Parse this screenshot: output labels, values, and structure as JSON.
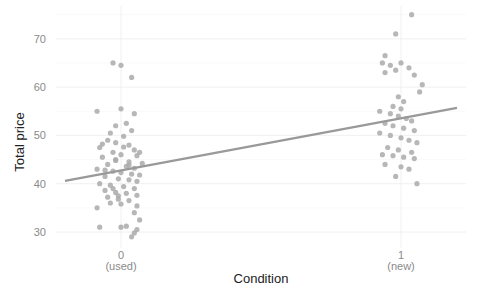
{
  "chart_data": {
    "type": "scatter",
    "title": "",
    "xlabel": "Condition",
    "ylabel": "Total price",
    "ylim": [
      27,
      76
    ],
    "yticks": [
      30,
      40,
      50,
      60,
      70
    ],
    "xticks": [
      {
        "value": 0,
        "label": "0",
        "sublabel": "(used)"
      },
      {
        "value": 1,
        "label": "1",
        "sublabel": "(new)"
      }
    ],
    "grid": true,
    "legend": null,
    "point_color": "#aaaaaa",
    "line_color": "#999999",
    "regression_line": {
      "x": [
        -0.2,
        1.2
      ],
      "y": [
        40.6,
        55.7
      ]
    },
    "series": [
      {
        "name": "used",
        "x_center": 0,
        "points": [
          [
            -0.03,
            65.0
          ],
          [
            0.0,
            64.5
          ],
          [
            0.04,
            62.0
          ],
          [
            -0.09,
            55.0
          ],
          [
            0.0,
            55.5
          ],
          [
            0.05,
            54.5
          ],
          [
            -0.02,
            52.0
          ],
          [
            0.02,
            52.5
          ],
          [
            -0.04,
            50.5
          ],
          [
            0.01,
            49.8
          ],
          [
            -0.05,
            49.0
          ],
          [
            -0.02,
            48.5
          ],
          [
            0.03,
            48.0
          ],
          [
            -0.08,
            47.5
          ],
          [
            0.05,
            47.0
          ],
          [
            -0.03,
            46.5
          ],
          [
            0.0,
            46.0
          ],
          [
            0.06,
            45.8
          ],
          [
            -0.07,
            45.5
          ],
          [
            -0.02,
            45.0
          ],
          [
            0.03,
            44.5
          ],
          [
            -0.05,
            44.0
          ],
          [
            0.02,
            43.6
          ],
          [
            0.05,
            43.2
          ],
          [
            -0.09,
            43.0
          ],
          [
            -0.03,
            42.6
          ],
          [
            0.0,
            42.3
          ],
          [
            0.04,
            42.0
          ],
          [
            0.07,
            41.8
          ],
          [
            -0.06,
            41.5
          ],
          [
            -0.01,
            41.0
          ],
          [
            0.03,
            40.8
          ],
          [
            0.06,
            40.5
          ],
          [
            -0.08,
            40.0
          ],
          [
            -0.04,
            39.7
          ],
          [
            0.01,
            39.4
          ],
          [
            0.05,
            39.0
          ],
          [
            -0.06,
            38.6
          ],
          [
            -0.02,
            38.2
          ],
          [
            0.02,
            38.0
          ],
          [
            0.06,
            37.6
          ],
          [
            -0.05,
            37.2
          ],
          [
            -0.01,
            36.8
          ],
          [
            0.03,
            36.5
          ],
          [
            -0.04,
            36.0
          ],
          [
            0.0,
            35.8
          ],
          [
            0.06,
            35.4
          ],
          [
            -0.09,
            35.0
          ],
          [
            0.05,
            34.0
          ],
          [
            0.07,
            32.5
          ],
          [
            -0.08,
            31.0
          ],
          [
            0.02,
            31.2
          ],
          [
            0.0,
            31.0
          ],
          [
            0.06,
            30.5
          ],
          [
            0.05,
            29.8
          ],
          [
            0.04,
            29.0
          ],
          [
            -0.02,
            44.8
          ],
          [
            0.01,
            47.6
          ],
          [
            -0.06,
            42.8
          ],
          [
            0.08,
            44.2
          ],
          [
            -0.03,
            39.0
          ],
          [
            0.07,
            46.5
          ],
          [
            -0.07,
            48.2
          ],
          [
            0.04,
            51.0
          ],
          [
            -0.01,
            37.5
          ],
          [
            0.03,
            43.8
          ]
        ]
      },
      {
        "name": "new",
        "x_center": 1,
        "points": [
          [
            0.04,
            75.0
          ],
          [
            -0.02,
            71.0
          ],
          [
            -0.06,
            66.5
          ],
          [
            -0.07,
            65.0
          ],
          [
            -0.04,
            64.5
          ],
          [
            0.0,
            65.0
          ],
          [
            0.03,
            64.0
          ],
          [
            -0.06,
            63.0
          ],
          [
            -0.02,
            63.5
          ],
          [
            0.05,
            62.5
          ],
          [
            0.08,
            60.5
          ],
          [
            0.07,
            59.0
          ],
          [
            -0.01,
            58.0
          ],
          [
            0.01,
            57.0
          ],
          [
            -0.03,
            56.0
          ],
          [
            0.0,
            55.5
          ],
          [
            -0.08,
            55.0
          ],
          [
            -0.04,
            54.5
          ],
          [
            -0.01,
            54.0
          ],
          [
            0.02,
            53.5
          ],
          [
            0.04,
            53.0
          ],
          [
            -0.06,
            52.5
          ],
          [
            -0.03,
            52.0
          ],
          [
            0.01,
            51.5
          ],
          [
            0.05,
            51.0
          ],
          [
            -0.08,
            50.5
          ],
          [
            -0.04,
            50.0
          ],
          [
            0.0,
            49.5
          ],
          [
            0.03,
            49.0
          ],
          [
            0.06,
            48.5
          ],
          [
            -0.05,
            47.5
          ],
          [
            -0.01,
            47.0
          ],
          [
            0.04,
            46.5
          ],
          [
            -0.07,
            46.0
          ],
          [
            -0.03,
            45.8
          ],
          [
            0.01,
            45.5
          ],
          [
            0.05,
            45.2
          ],
          [
            -0.06,
            44.0
          ],
          [
            0.0,
            43.5
          ],
          [
            0.03,
            43.0
          ],
          [
            -0.02,
            41.5
          ],
          [
            0.06,
            40.0
          ]
        ]
      }
    ]
  }
}
